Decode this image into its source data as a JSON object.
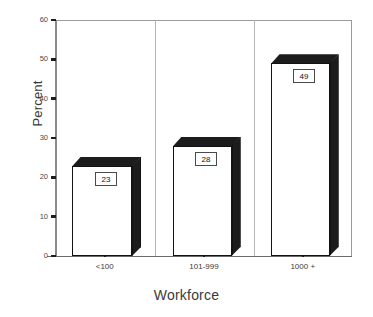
{
  "chart_data": {
    "type": "bar",
    "title": "",
    "subtitle": "",
    "categories": [
      "<100",
      "101-999",
      "1000 +"
    ],
    "values": [
      23,
      28,
      49
    ],
    "data_labels": [
      "23",
      "28",
      "49"
    ],
    "xlabel": "Workforce",
    "ylabel": "Percent",
    "ylim": [
      0,
      60
    ],
    "yticks": [
      0,
      10,
      20,
      30,
      40,
      50,
      60
    ],
    "ytick_labels": [
      "0",
      "10",
      "20",
      "30",
      "40",
      "50",
      "60"
    ],
    "grid": false,
    "legend": null,
    "legend_position": "none",
    "style": "3d-bar",
    "colors": {
      "bar_face": "#ffffff",
      "bar_shade": "#1c1c1c",
      "bar_outline": "#121212",
      "axis": "#8a8a8a",
      "text": "#3a3a3a",
      "label_box_border": "#4a4a4a"
    }
  }
}
